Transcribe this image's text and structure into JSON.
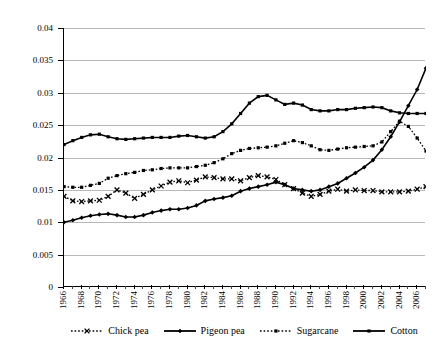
{
  "chart_data": {
    "type": "line",
    "title": "",
    "xlabel": "",
    "ylabel": "",
    "ylim": [
      0,
      0.04
    ],
    "xlim": [
      1966,
      2007
    ],
    "grid": true,
    "legend_position": "bottom",
    "y_ticks": [
      "0",
      "0.005",
      "0.01",
      "0.015",
      "0.02",
      "0.025",
      "0.03",
      "0.035",
      "0.04"
    ],
    "y_tick_values": [
      0,
      0.005,
      0.01,
      0.015,
      0.02,
      0.025,
      0.03,
      0.035,
      0.04
    ],
    "x_tick_labels": [
      "1966",
      "1968",
      "1970",
      "1972",
      "1974",
      "1976",
      "1978",
      "1980",
      "1982",
      "1984",
      "1986",
      "1988",
      "1990",
      "1992",
      "1994",
      "1996",
      "1998",
      "2000",
      "2002",
      "2004",
      "2006"
    ],
    "x": [
      1966,
      1967,
      1968,
      1969,
      1970,
      1971,
      1972,
      1973,
      1974,
      1975,
      1976,
      1977,
      1978,
      1979,
      1980,
      1981,
      1982,
      1983,
      1984,
      1985,
      1986,
      1987,
      1988,
      1989,
      1990,
      1991,
      1992,
      1993,
      1994,
      1995,
      1996,
      1997,
      1998,
      1999,
      2000,
      2001,
      2002,
      2003,
      2004,
      2005,
      2006,
      2007
    ],
    "series": [
      {
        "name": "Chick pea",
        "marker": "x",
        "line_style": "dotted",
        "color": "#000000",
        "values": [
          0.014,
          0.0133,
          0.0132,
          0.0133,
          0.0134,
          0.014,
          0.015,
          0.0145,
          0.0137,
          0.0143,
          0.015,
          0.0156,
          0.0162,
          0.0164,
          0.0161,
          0.0165,
          0.017,
          0.0169,
          0.0167,
          0.0167,
          0.0164,
          0.0169,
          0.0172,
          0.017,
          0.0166,
          0.0158,
          0.0152,
          0.0145,
          0.014,
          0.0143,
          0.0148,
          0.0151,
          0.0148,
          0.015,
          0.0149,
          0.0149,
          0.0147,
          0.0147,
          0.0147,
          0.0148,
          0.0151,
          0.0155
        ]
      },
      {
        "name": "Pigeon pea",
        "marker": "diamond",
        "line_style": "solid",
        "color": "#000000",
        "values": [
          0.01,
          0.0103,
          0.0107,
          0.011,
          0.0112,
          0.0113,
          0.0111,
          0.0108,
          0.0108,
          0.0111,
          0.0115,
          0.0118,
          0.012,
          0.012,
          0.0122,
          0.0126,
          0.0133,
          0.0136,
          0.0138,
          0.0141,
          0.0148,
          0.0152,
          0.0155,
          0.0158,
          0.0162,
          0.0158,
          0.0152,
          0.015,
          0.0148,
          0.015,
          0.0155,
          0.016,
          0.0168,
          0.0176,
          0.0185,
          0.0196,
          0.0212,
          0.0232,
          0.0255,
          0.028,
          0.0305,
          0.0338
        ]
      },
      {
        "name": "Sugarcane",
        "marker": "square",
        "line_style": "dotted",
        "color": "#000000",
        "values": [
          0.0155,
          0.0154,
          0.0154,
          0.0157,
          0.016,
          0.0168,
          0.0172,
          0.0175,
          0.0177,
          0.018,
          0.0181,
          0.0183,
          0.0184,
          0.0184,
          0.0184,
          0.0186,
          0.0188,
          0.0192,
          0.0198,
          0.0206,
          0.0211,
          0.0214,
          0.0215,
          0.0216,
          0.0218,
          0.0222,
          0.0226,
          0.0223,
          0.0218,
          0.0212,
          0.0211,
          0.0213,
          0.0215,
          0.0216,
          0.0217,
          0.0218,
          0.0224,
          0.024,
          0.0256,
          0.0248,
          0.023,
          0.021
        ]
      },
      {
        "name": "Cotton",
        "marker": "square-filled",
        "line_style": "solid",
        "color": "#000000",
        "values": [
          0.022,
          0.0226,
          0.0231,
          0.0235,
          0.0236,
          0.0232,
          0.0229,
          0.0228,
          0.0229,
          0.023,
          0.0231,
          0.0231,
          0.0231,
          0.0233,
          0.0234,
          0.0232,
          0.023,
          0.0232,
          0.024,
          0.0252,
          0.0268,
          0.0284,
          0.0294,
          0.0296,
          0.0289,
          0.0282,
          0.0284,
          0.0281,
          0.0274,
          0.0272,
          0.0272,
          0.0274,
          0.0274,
          0.0276,
          0.0277,
          0.0278,
          0.0277,
          0.0272,
          0.0269,
          0.0268,
          0.0268,
          0.0268
        ]
      }
    ]
  },
  "legend": {
    "items": [
      {
        "label": "Chick pea"
      },
      {
        "label": "Pigeon pea"
      },
      {
        "label": "Sugarcane"
      },
      {
        "label": "Cotton"
      }
    ]
  }
}
